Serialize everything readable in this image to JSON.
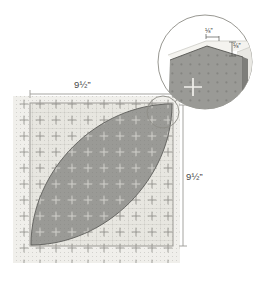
{
  "diagram": {
    "square": {
      "width_label": "9½”",
      "height_label": "9½”"
    },
    "detail_callout": {
      "top_measure_label": "⅛”",
      "side_measure_label": "⅛”"
    },
    "colors": {
      "mat_base": "#f0efeb",
      "mat_inner": "#e4e3dd",
      "grid_line": "#b9b8b2",
      "plus_mark": "#8d8c86",
      "leaf_fill": "#9a9a96",
      "leaf_stroke": "#5e5e5a",
      "dim_line": "#9b9a95",
      "text": "#4a4a4a",
      "callout_stroke": "#8d8c86",
      "bevel_light": "#efeee9",
      "bevel_mid": "#d2d1cb"
    }
  }
}
